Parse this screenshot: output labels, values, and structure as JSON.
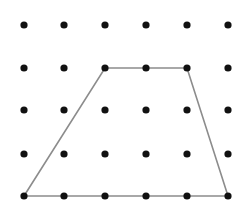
{
  "figure": {
    "background_color": "#ffffff",
    "width": 249,
    "height": 208
  },
  "chart_data": {
    "type": "scatter",
    "xlabel": "",
    "ylabel": "",
    "grid": false,
    "legend": false,
    "xlim": [
      0,
      249
    ],
    "ylim": [
      208,
      0
    ],
    "grid_columns": 6,
    "grid_rows": 5,
    "column_x": [
      24,
      64,
      105,
      146,
      187,
      228
    ],
    "row_y": [
      25,
      68,
      110,
      154,
      196
    ],
    "dot_radius": 3.6,
    "dot_color": "#111111",
    "points": [
      {
        "col": 1,
        "row": 1,
        "x": 24,
        "y": 25
      },
      {
        "col": 2,
        "row": 1,
        "x": 64,
        "y": 25
      },
      {
        "col": 3,
        "row": 1,
        "x": 105,
        "y": 25
      },
      {
        "col": 4,
        "row": 1,
        "x": 146,
        "y": 25
      },
      {
        "col": 5,
        "row": 1,
        "x": 187,
        "y": 25
      },
      {
        "col": 6,
        "row": 1,
        "x": 228,
        "y": 25
      },
      {
        "col": 1,
        "row": 2,
        "x": 24,
        "y": 68
      },
      {
        "col": 2,
        "row": 2,
        "x": 64,
        "y": 68
      },
      {
        "col": 3,
        "row": 2,
        "x": 105,
        "y": 68
      },
      {
        "col": 4,
        "row": 2,
        "x": 146,
        "y": 68
      },
      {
        "col": 5,
        "row": 2,
        "x": 187,
        "y": 68
      },
      {
        "col": 6,
        "row": 2,
        "x": 228,
        "y": 68
      },
      {
        "col": 1,
        "row": 3,
        "x": 24,
        "y": 110
      },
      {
        "col": 2,
        "row": 3,
        "x": 64,
        "y": 110
      },
      {
        "col": 3,
        "row": 3,
        "x": 105,
        "y": 110
      },
      {
        "col": 4,
        "row": 3,
        "x": 146,
        "y": 110
      },
      {
        "col": 5,
        "row": 3,
        "x": 187,
        "y": 110
      },
      {
        "col": 6,
        "row": 3,
        "x": 228,
        "y": 110
      },
      {
        "col": 1,
        "row": 4,
        "x": 24,
        "y": 154
      },
      {
        "col": 2,
        "row": 4,
        "x": 64,
        "y": 154
      },
      {
        "col": 3,
        "row": 4,
        "x": 105,
        "y": 154
      },
      {
        "col": 4,
        "row": 4,
        "x": 146,
        "y": 154
      },
      {
        "col": 5,
        "row": 4,
        "x": 187,
        "y": 154
      },
      {
        "col": 6,
        "row": 4,
        "x": 228,
        "y": 154
      },
      {
        "col": 1,
        "row": 5,
        "x": 24,
        "y": 196
      },
      {
        "col": 2,
        "row": 5,
        "x": 64,
        "y": 196
      },
      {
        "col": 3,
        "row": 5,
        "x": 105,
        "y": 196
      },
      {
        "col": 4,
        "row": 5,
        "x": 146,
        "y": 196
      },
      {
        "col": 5,
        "row": 5,
        "x": 187,
        "y": 196
      },
      {
        "col": 6,
        "row": 5,
        "x": 228,
        "y": 196
      }
    ],
    "shapes": [
      {
        "name": "trapezoid",
        "stroke_color": "#8c8c8c",
        "stroke_width": 1.6,
        "fill": "none",
        "closed": true,
        "vertices": [
          {
            "x": 24,
            "y": 196,
            "col": 1,
            "row": 5
          },
          {
            "x": 105,
            "y": 68,
            "col": 3,
            "row": 2
          },
          {
            "x": 187,
            "y": 68,
            "col": 5,
            "row": 2
          },
          {
            "x": 228,
            "y": 196,
            "col": 6,
            "row": 5
          }
        ],
        "points_attr": "24,196 105,68 187,68 228,196"
      }
    ]
  }
}
